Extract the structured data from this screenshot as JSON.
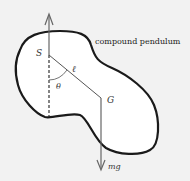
{
  "diagram": {
    "caption": "compound pendulum",
    "labels": {
      "pivot": "S",
      "length": "ℓ",
      "angle": "θ",
      "center_of_mass": "G",
      "weight": "mg"
    },
    "colors": {
      "background": "#f2f2f2",
      "outline": "#1a1a1a",
      "lines": "#555555"
    }
  }
}
